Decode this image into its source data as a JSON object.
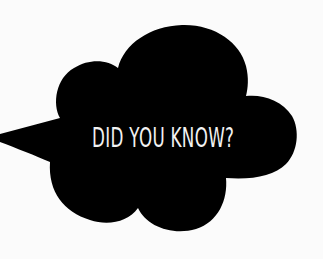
{
  "graphic": {
    "type": "speech-bubble-cloud",
    "text": "DID YOU KNOW?",
    "colors": {
      "background": "#fbfbfb",
      "bubble_fill": "#000000",
      "text": "#f2f2f2"
    }
  }
}
